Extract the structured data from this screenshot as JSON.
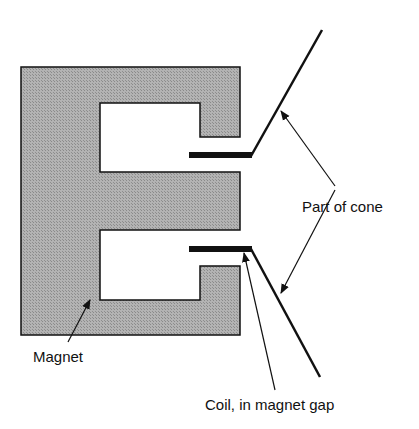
{
  "diagram": {
    "colors": {
      "magnet_fill": "#a9a9a9",
      "outline": "#111111",
      "background": "#ffffff"
    },
    "labels": {
      "part_of_cone": "Part of cone",
      "magnet": "Magnet",
      "coil": "Coil, in magnet gap"
    }
  }
}
